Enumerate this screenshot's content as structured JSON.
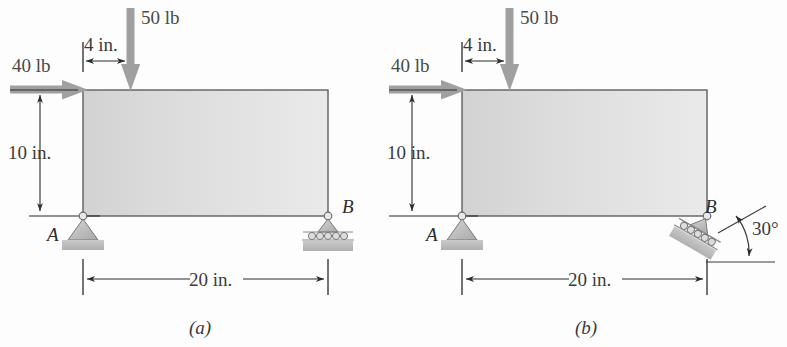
{
  "figure": {
    "title_caption_a": "(a)",
    "title_caption_b": "(b)",
    "colors": {
      "body_fill_light": "#e4e4e4",
      "body_fill_dark": "#cccccc",
      "body_stroke": "#5a5a5a",
      "arrow_gray": "#9a9a9a",
      "dim_black": "#2b2b2b",
      "support_gray": "#b8b8b8",
      "text_gray": "#4a4a4a"
    }
  },
  "panels": [
    {
      "id": "panel-a",
      "caption": "(a)",
      "loads": [
        {
          "name": "horizontal-load",
          "label": "40 lb",
          "direction": "right",
          "magnitude": 40,
          "unit": "lb"
        },
        {
          "name": "vertical-load",
          "label": "50 lb",
          "direction": "down",
          "magnitude": 50,
          "unit": "lb"
        }
      ],
      "dimensions": [
        {
          "name": "offset-dimension",
          "label": "4 in.",
          "value": 4,
          "unit": "in.",
          "orientation": "horizontal"
        },
        {
          "name": "height-dimension",
          "label": "10 in.",
          "value": 10,
          "unit": "in.",
          "orientation": "vertical"
        },
        {
          "name": "span-dimension",
          "label": "20 in.",
          "value": 20,
          "unit": "in.",
          "orientation": "horizontal"
        }
      ],
      "supports": [
        {
          "name": "support-a",
          "label": "A",
          "type": "pin"
        },
        {
          "name": "support-b",
          "label": "B",
          "type": "roller"
        }
      ],
      "angles": []
    },
    {
      "id": "panel-b",
      "caption": "(b)",
      "loads": [
        {
          "name": "horizontal-load",
          "label": "40 lb",
          "direction": "right",
          "magnitude": 40,
          "unit": "lb"
        },
        {
          "name": "vertical-load",
          "label": "50 lb",
          "direction": "down",
          "magnitude": 50,
          "unit": "lb"
        }
      ],
      "dimensions": [
        {
          "name": "offset-dimension",
          "label": "4 in.",
          "value": 4,
          "unit": "in.",
          "orientation": "horizontal"
        },
        {
          "name": "height-dimension",
          "label": "10 in.",
          "value": 10,
          "unit": "in.",
          "orientation": "vertical"
        },
        {
          "name": "span-dimension",
          "label": "20 in.",
          "value": 20,
          "unit": "in.",
          "orientation": "horizontal"
        }
      ],
      "supports": [
        {
          "name": "support-a",
          "label": "A",
          "type": "pin"
        },
        {
          "name": "support-b",
          "label": "B",
          "type": "inclined-roller"
        }
      ],
      "angles": [
        {
          "name": "incline-angle",
          "label": "30°",
          "value": 30,
          "unit": "deg"
        }
      ]
    }
  ]
}
